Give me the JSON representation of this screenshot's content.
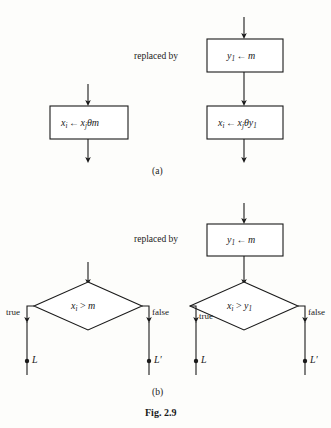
{
  "figure": {
    "caption": "Fig. 2.9",
    "parts": [
      {
        "id": "a",
        "label": "(a)"
      },
      {
        "id": "b",
        "label": "(b)"
      }
    ],
    "connector_label": "replaced by"
  },
  "part_a": {
    "label": "(a)",
    "replaced_by": "replaced by",
    "left_flow": {
      "process_box": {
        "target": "x",
        "target_sub": "i",
        "arrow": "←",
        "source": "x",
        "source_sub": "j",
        "theta": "θ",
        "operand": "m",
        "full_text": "x_i ← x_jθm"
      }
    },
    "right_flow": {
      "box_1": {
        "target": "y",
        "target_sub": "1",
        "arrow": "←",
        "operand": "m",
        "full_text": "y_1 ← m"
      },
      "box_2": {
        "target": "x",
        "target_sub": "i",
        "arrow": "←",
        "source": "x",
        "source_sub": "j",
        "theta": "θ",
        "operand": "y",
        "operand_sub": "1",
        "full_text": "x_i ← x_jθy_1"
      }
    }
  },
  "part_b": {
    "label": "(b)",
    "replaced_by": "replaced by",
    "left_flow": {
      "decision": {
        "lhs": "x",
        "lhs_sub": "i",
        "comparator": ">",
        "rhs": "m",
        "full_text": "x_i > m"
      },
      "branch_true_label": "true",
      "branch_false_label": "false",
      "target_true": "L",
      "target_false": "L′"
    },
    "right_flow": {
      "box_1": {
        "target": "y",
        "target_sub": "1",
        "arrow": "←",
        "operand": "m",
        "full_text": "y_1 ← m"
      },
      "decision": {
        "lhs": "x",
        "lhs_sub": "i",
        "comparator": ">",
        "rhs": "y",
        "rhs_sub": "1",
        "full_text": "x_i > y_1"
      },
      "branch_true_label": "true",
      "branch_false_label": "false",
      "target_true": "L",
      "target_false": "L′"
    }
  },
  "style": {
    "stroke": "#1a1a1a",
    "background": "#fdfdfb",
    "box_fill": "#ffffff"
  }
}
